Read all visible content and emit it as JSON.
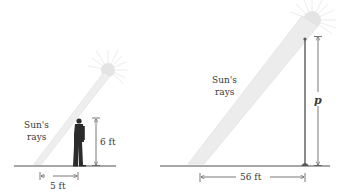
{
  "left_figure": {
    "rays_label_line1": "Sun's",
    "rays_label_line2": "rays",
    "height_label": "6 ft",
    "shadow_label": "5 ft",
    "subject": "person"
  },
  "right_figure": {
    "rays_label_line1": "Sun's",
    "rays_label_line2": "rays",
    "height_label": "p",
    "shadow_label": "56 ft",
    "subject": "pole"
  },
  "colors": {
    "ground": "#8a8a8a",
    "ray_fill": "#ececec",
    "ray_edge": "#d8d8d8",
    "sun": "#e2e2e2",
    "person": "#2b2b2b",
    "pole": "#555555",
    "dimension_line": "#555555",
    "text": "#3a3a3a"
  }
}
